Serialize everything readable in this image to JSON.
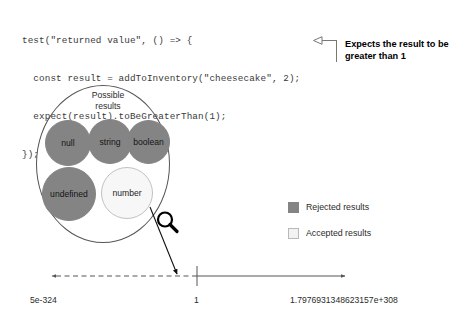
{
  "code": {
    "lines": [
      "test(\"returned value\", () => {",
      "  const result = addToInventory(\"cheesecake\", 2);",
      "  expect(result).toBeGreaterThan(1);",
      "});"
    ]
  },
  "callout": {
    "text": "Expects the result to be greater than 1",
    "arrow_icon": "left-triangle-arrow-icon"
  },
  "diagram": {
    "set_title": "Possible results",
    "bubbles": [
      {
        "label": "null",
        "state": "rejected"
      },
      {
        "label": "string",
        "state": "rejected"
      },
      {
        "label": "boolean",
        "state": "rejected"
      },
      {
        "label": "undefined",
        "state": "rejected"
      },
      {
        "label": "number",
        "state": "accepted"
      }
    ],
    "magnifier_icon": "magnifying-glass-icon",
    "pointer_icon": "arrow-pointer-icon"
  },
  "legend": {
    "items": [
      {
        "label": "Rejected results",
        "state": "rejected"
      },
      {
        "label": "Accepted results",
        "state": "accepted"
      }
    ]
  },
  "axis": {
    "min_label": "5e-324",
    "mid_label": "1",
    "max_label": "1.7976931348623157e+308"
  },
  "colors": {
    "rejected_fill": "#848484",
    "accepted_fill": "#f7f7f7",
    "accepted_stroke": "#c2c2c2",
    "outline": "#555555",
    "code_text": "#3a3a3a",
    "axis_stroke": "#555555"
  }
}
